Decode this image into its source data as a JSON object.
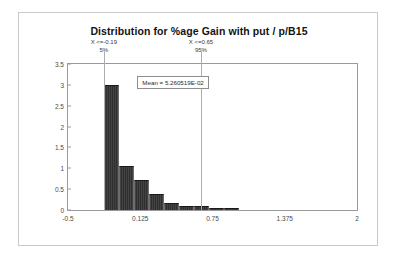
{
  "figure": {
    "title": "Distribution for %age Gain with put / p/B15",
    "mean_label": "Mean = 5.260519E-02"
  },
  "annotations": {
    "left": {
      "x_label": "X <=-0.19",
      "pct_label": "5%",
      "x_value": -0.19,
      "percentile": 5
    },
    "right": {
      "x_label": "X <=0.65",
      "pct_label": "95%",
      "x_value": 0.65,
      "percentile": 95
    }
  },
  "chart_data": {
    "type": "bar",
    "title": "Distribution for %age Gain with put / p/B15",
    "xlabel": "",
    "ylabel": "",
    "xlim": [
      -0.5,
      2.0
    ],
    "ylim": [
      0,
      3.5
    ],
    "grid": false,
    "legend": null,
    "x_ticks": [
      "-0.5",
      "0.125",
      "0.75",
      "1.375",
      "2"
    ],
    "x_tick_values": [
      -0.5,
      0.125,
      0.75,
      1.375,
      2
    ],
    "y_ticks": [
      "0",
      "0.5",
      "1",
      "1.5",
      "2",
      "2.5",
      "3",
      "3.5"
    ],
    "y_tick_values": [
      0,
      0.5,
      1,
      1.5,
      2,
      2.5,
      3,
      3.5
    ],
    "bin_edges": [
      -0.19,
      -0.06,
      0.07,
      0.2,
      0.33,
      0.46,
      0.59,
      0.72,
      0.85,
      0.98
    ],
    "values": [
      3.0,
      1.05,
      0.72,
      0.38,
      0.17,
      0.1,
      0.1,
      0.06,
      0.04
    ],
    "mean": 0.05260519,
    "mean_label": "Mean = 5.260519E-02",
    "percentile_markers": [
      {
        "label": "X <=-0.19",
        "pct": "5%",
        "x": -0.19
      },
      {
        "label": "X <=0.65",
        "pct": "95%",
        "x": 0.65
      }
    ]
  }
}
